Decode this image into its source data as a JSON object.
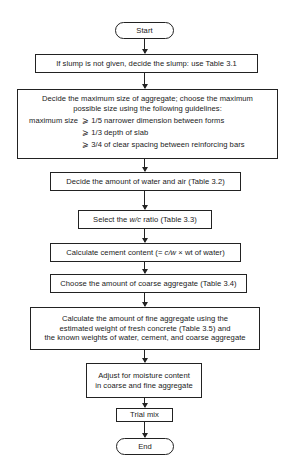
{
  "flowchart": {
    "start": "Start",
    "end": "End",
    "steps": [
      {
        "lines": [
          "If slump is not given, decide the slump:  use Table 3.1"
        ]
      },
      {
        "lines": [
          "Decide the maximum size of aggregate; choose the maximum",
          "possible size using the following guidelines:"
        ],
        "guidelines": {
          "label": "maximum size",
          "items": [
            "⩾ 1/5 narrower dimension between forms",
            "⩾ 1/3 depth of slab",
            "⩾ 3/4 of clear spacing between reinforcing bars"
          ]
        }
      },
      {
        "lines": [
          "Decide the amount of water and air (Table 3.2)"
        ]
      },
      {
        "prefix": "Select the ",
        "italic": "w/c",
        "suffix": " ratio (Table 3.3)"
      },
      {
        "prefix": "Calculate cement content (= ",
        "italic": "c/w",
        "suffix": " × wt of water)"
      },
      {
        "lines": [
          "Choose the amount of coarse aggregate (Table 3.4)"
        ]
      },
      {
        "lines": [
          "Calculate the amount of fine aggregate using the",
          "estimated weight of fresh concrete (Table 3.5) and",
          "the known weights of water, cement, and coarse aggregate"
        ]
      },
      {
        "lines": [
          "Adjust for moisture content",
          "in coarse and fine aggregate"
        ]
      },
      {
        "lines": [
          "Trial mix"
        ]
      }
    ]
  }
}
